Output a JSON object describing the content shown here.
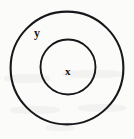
{
  "diagram": {
    "type": "euler-nested-circles",
    "background_color": "#fbfbfa",
    "stroke_color": "#17161a",
    "sets": [
      {
        "id": "outer",
        "label": "y",
        "role": "containing-set",
        "center_x": 67,
        "center_y": 68,
        "radius": 57,
        "stroke_width": 2.1
      },
      {
        "id": "inner",
        "label": "x",
        "role": "contained-subset",
        "center_x": 68,
        "center_y": 67,
        "radius": 28,
        "stroke_width": 1.9
      }
    ],
    "labels": {
      "outer_label": "y",
      "inner_label": "x"
    }
  }
}
